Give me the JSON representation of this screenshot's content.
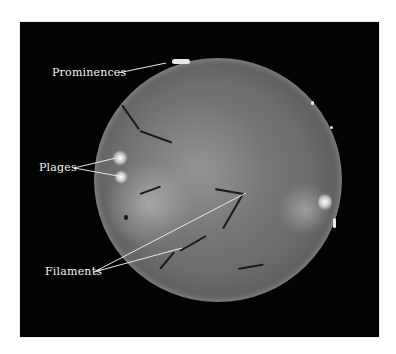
{
  "figure": {
    "background_color": "#030303",
    "page_color": "#ffffff",
    "labels": [
      {
        "id": "prominences",
        "text": "Prominences"
      },
      {
        "id": "plages",
        "text": "Plages"
      },
      {
        "id": "filaments",
        "text": "Filaments"
      }
    ]
  }
}
